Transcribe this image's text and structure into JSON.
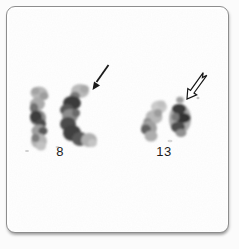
{
  "figure": {
    "panel_background": "#ffffff",
    "frame_border_color": "#8d8d8d",
    "annotation_color": "#1a1a1a",
    "groups": [
      {
        "label": "8",
        "arrow_icon": "solid-arrow-down-left-icon"
      },
      {
        "label": "13",
        "arrow_icon": "open-arrow-down-left-icon"
      }
    ]
  }
}
